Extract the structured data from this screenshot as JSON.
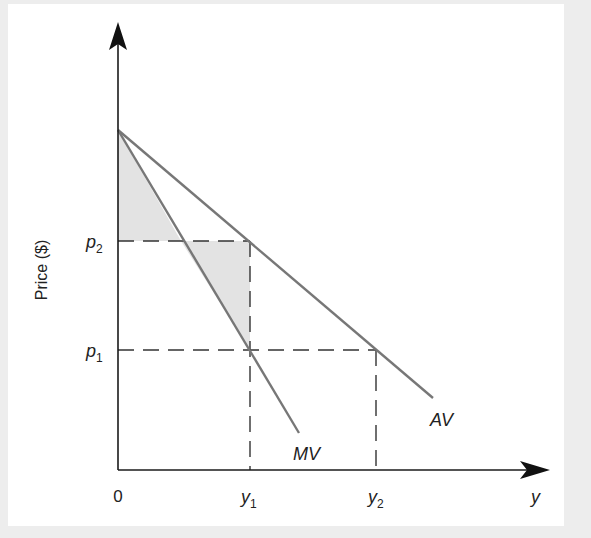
{
  "diagram": {
    "y_axis_label": "Price ($)",
    "x_axis_label": "y",
    "origin_label": "0",
    "price_ticks": [
      {
        "symbol": "p",
        "sub": "2"
      },
      {
        "symbol": "p",
        "sub": "1"
      }
    ],
    "quantity_ticks": [
      {
        "symbol": "y",
        "sub": "1"
      },
      {
        "symbol": "y",
        "sub": "2"
      }
    ],
    "curves": [
      {
        "name": "AV",
        "label": "AV",
        "description": "Average value curve"
      },
      {
        "name": "MV",
        "label": "MV",
        "description": "Marginal value curve"
      }
    ],
    "colors": {
      "axis": "#1a1a1a",
      "curve": "#777777",
      "shade": "#e3e3e3",
      "dash": "#333333",
      "background": "#ededed",
      "panel": "#ffffff"
    }
  }
}
